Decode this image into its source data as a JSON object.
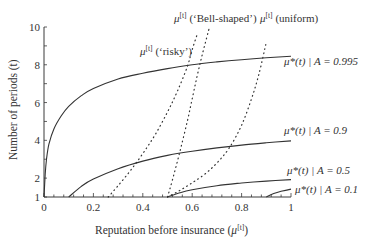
{
  "chart_data": {
    "type": "line",
    "title": "",
    "xlabel": "Reputation before insurance (μ[t])",
    "ylabel": "Number of periods (t)",
    "xlim": [
      0,
      1
    ],
    "ylim": [
      1,
      10
    ],
    "grid": false,
    "legend": "inline labels",
    "x_ticks": [
      0,
      0.2,
      0.4,
      0.6,
      0.8,
      1
    ],
    "x_tick_labels": [
      "0",
      "0.2",
      "0.4",
      "0.6",
      "0.8",
      "1"
    ],
    "y_ticks": [
      1,
      2,
      4,
      6,
      8,
      10
    ],
    "y_tick_labels": [
      "1",
      "2",
      "4",
      "6",
      "8",
      "10"
    ],
    "series": [
      {
        "name": "μ*(t) | A = 0.995",
        "style": "solid",
        "x": [
          0,
          0.005,
          0.01,
          0.02,
          0.04,
          0.07,
          0.1,
          0.15,
          0.2,
          0.3,
          0.4,
          0.5,
          0.6,
          0.7,
          0.8,
          0.9,
          1.0
        ],
        "y": [
          1,
          2.2,
          3.0,
          3.8,
          4.6,
          5.3,
          5.8,
          6.35,
          6.75,
          7.25,
          7.55,
          7.8,
          8.0,
          8.15,
          8.27,
          8.37,
          8.45
        ]
      },
      {
        "name": "μ*(t) | A = 0.9",
        "style": "solid",
        "x": [
          0.1,
          0.15,
          0.2,
          0.3,
          0.4,
          0.5,
          0.6,
          0.7,
          0.8,
          0.9,
          1.0
        ],
        "y": [
          1,
          1.55,
          1.95,
          2.5,
          2.9,
          3.2,
          3.42,
          3.6,
          3.75,
          3.87,
          3.97
        ]
      },
      {
        "name": "μ*(t) | A = 0.5",
        "style": "solid",
        "x": [
          0.5,
          0.55,
          0.6,
          0.7,
          0.8,
          0.9,
          1.0
        ],
        "y": [
          1,
          1.22,
          1.38,
          1.6,
          1.74,
          1.84,
          1.92
        ]
      },
      {
        "name": "μ*(t) | A = 0.1",
        "style": "solid",
        "x": [
          0.9,
          0.93,
          0.96,
          1.0
        ],
        "y": [
          1,
          1.18,
          1.3,
          1.42
        ]
      },
      {
        "name": "μ[t] ('risky')",
        "style": "dotted",
        "x": [
          0.26,
          0.3,
          0.35,
          0.4,
          0.45,
          0.5,
          0.54,
          0.58,
          0.6,
          0.62
        ],
        "y": [
          1,
          1.6,
          2.4,
          3.3,
          4.3,
          5.5,
          6.6,
          7.9,
          8.8,
          9.6
        ]
      },
      {
        "name": "μ[t] ('Bell-shaped')",
        "style": "dotted",
        "x": [
          0.5,
          0.52,
          0.55,
          0.58,
          0.6,
          0.62,
          0.64,
          0.66,
          0.67
        ],
        "y": [
          1,
          1.9,
          3.4,
          5.0,
          6.2,
          7.4,
          8.5,
          9.5,
          10
        ]
      },
      {
        "name": "μ[t] (uniform)",
        "style": "dotted",
        "x": [
          0.5,
          0.55,
          0.6,
          0.65,
          0.7,
          0.75,
          0.8,
          0.84,
          0.87,
          0.9
        ],
        "y": [
          1,
          1.35,
          1.75,
          2.2,
          2.8,
          3.6,
          4.8,
          6.2,
          7.5,
          9.2
        ]
      }
    ],
    "annotations": [
      {
        "text": "μ[t] ('risky')",
        "x": 0.36,
        "y": 8.9
      },
      {
        "text": "μ[t] ('Bell-shaped')",
        "x": 0.5,
        "y": 10.2
      },
      {
        "text": "μ[t] (uniform)",
        "x": 0.78,
        "y": 10.2
      },
      {
        "text": "μ*(t) | A = 0.995",
        "x": 1.01,
        "y": 8.1
      },
      {
        "text": "μ*(t) | A = 0.9",
        "x": 1.01,
        "y": 4.4
      },
      {
        "text": "μ*(t) | A = 0.5",
        "x": 1.01,
        "y": 2.2
      },
      {
        "text": "μ*(t) | A = 0.1",
        "x": 1.03,
        "y": 1.45
      }
    ]
  },
  "labels": {
    "xlabel_main": "Reputation before insurance (",
    "xlabel_mu": "μ",
    "xlabel_sup": "[t]",
    "xlabel_close": ")",
    "ylabel": "Number of periods (t)",
    "risky_mu": "μ",
    "risky_sup": "[t]",
    "risky_text": " (‘risky’)",
    "bell_mu": "μ",
    "bell_sup": "[t]",
    "bell_text": " (‘Bell-shaped’)",
    "uniform_mu": "μ",
    "uniform_sup": "[t]",
    "uniform_text": " (uniform)",
    "a0995": "μ*(t) | A = 0.995",
    "a09": "μ*(t) | A = 0.9",
    "a05": "μ*(t) | A = 0.5",
    "a01": "μ*(t) | A = 0.1"
  }
}
